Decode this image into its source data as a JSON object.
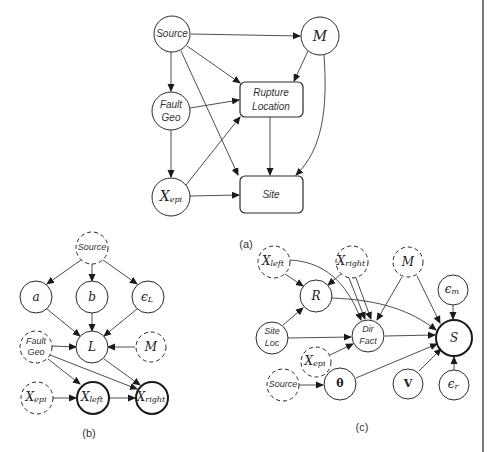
{
  "figure": {
    "panels": [
      {
        "id": "a",
        "caption": "(a)",
        "nodes": [
          {
            "id": "a_source",
            "label": "Source",
            "style": "solid",
            "shape": "circle"
          },
          {
            "id": "a_m",
            "label": "M",
            "style": "solid",
            "shape": "circle"
          },
          {
            "id": "a_faultgeo",
            "label_lines": [
              "Fault",
              "Geo"
            ],
            "style": "solid",
            "shape": "circle"
          },
          {
            "id": "a_rupture",
            "label_lines": [
              "Rupture",
              "Location"
            ],
            "style": "solid",
            "shape": "box"
          },
          {
            "id": "a_xepi",
            "label": "X",
            "sub": "epi",
            "style": "solid",
            "shape": "circle"
          },
          {
            "id": "a_site",
            "label": "Site",
            "style": "solid",
            "shape": "box"
          }
        ],
        "edges": [
          [
            "a_source",
            "a_m"
          ],
          [
            "a_source",
            "a_faultgeo"
          ],
          [
            "a_source",
            "a_rupture"
          ],
          [
            "a_source",
            "a_site"
          ],
          [
            "a_m",
            "a_rupture"
          ],
          [
            "a_m",
            "a_site"
          ],
          [
            "a_faultgeo",
            "a_rupture"
          ],
          [
            "a_faultgeo",
            "a_xepi"
          ],
          [
            "a_xepi",
            "a_rupture"
          ],
          [
            "a_xepi",
            "a_site"
          ],
          [
            "a_rupture",
            "a_site"
          ]
        ]
      },
      {
        "id": "b",
        "caption": "(b)",
        "nodes": [
          {
            "id": "b_source",
            "label": "Source",
            "style": "dashed"
          },
          {
            "id": "b_a",
            "label": "a",
            "style": "solid"
          },
          {
            "id": "b_b",
            "label": "b",
            "style": "solid"
          },
          {
            "id": "b_epsL",
            "label": "ϵ",
            "sub": "L",
            "style": "solid"
          },
          {
            "id": "b_faultgeo",
            "label_lines": [
              "Fault",
              "Geo"
            ],
            "style": "dashed"
          },
          {
            "id": "b_L",
            "label": "L",
            "style": "solid"
          },
          {
            "id": "b_m",
            "label": "M",
            "style": "dashed"
          },
          {
            "id": "b_xepi",
            "label": "X",
            "sub": "epi",
            "style": "dashed"
          },
          {
            "id": "b_xleft",
            "label": "X",
            "sub": "left",
            "style": "thick"
          },
          {
            "id": "b_xright",
            "label": "X",
            "sub": "right",
            "style": "thick"
          }
        ],
        "edges": [
          [
            "b_source",
            "b_a"
          ],
          [
            "b_source",
            "b_b"
          ],
          [
            "b_source",
            "b_epsL"
          ],
          [
            "b_a",
            "b_L"
          ],
          [
            "b_b",
            "b_L"
          ],
          [
            "b_epsL",
            "b_L"
          ],
          [
            "b_faultgeo",
            "b_L"
          ],
          [
            "b_m",
            "b_L"
          ],
          [
            "b_faultgeo",
            "b_xleft"
          ],
          [
            "b_faultgeo",
            "b_xright"
          ],
          [
            "b_L",
            "b_xright"
          ],
          [
            "b_xepi",
            "b_xleft"
          ],
          [
            "b_xleft",
            "b_xright"
          ]
        ]
      },
      {
        "id": "c",
        "caption": "(c)",
        "nodes": [
          {
            "id": "c_xleft",
            "label": "X",
            "sub": "left",
            "style": "dashed"
          },
          {
            "id": "c_xright",
            "label": "X",
            "sub": "right",
            "style": "dashed"
          },
          {
            "id": "c_m",
            "label": "M",
            "style": "dashed"
          },
          {
            "id": "c_epsm",
            "label": "ϵ",
            "sub": "m",
            "style": "solid"
          },
          {
            "id": "c_R",
            "label": "R",
            "style": "solid"
          },
          {
            "id": "c_siteloc",
            "label_lines": [
              "Site",
              "Loc"
            ],
            "style": "solid"
          },
          {
            "id": "c_dirfact",
            "label_lines": [
              "Dir",
              "Fact"
            ],
            "style": "solid"
          },
          {
            "id": "c_S",
            "label": "S",
            "style": "thick"
          },
          {
            "id": "c_xepi",
            "label": "X",
            "sub": "epi",
            "style": "dashed"
          },
          {
            "id": "c_source",
            "label": "Source",
            "style": "dashed"
          },
          {
            "id": "c_theta",
            "label": "θ",
            "style": "solid"
          },
          {
            "id": "c_V",
            "label": "V",
            "style": "solid"
          },
          {
            "id": "c_epsr",
            "label": "ϵ",
            "sub": "r",
            "style": "solid"
          }
        ],
        "edges": [
          [
            "c_xleft",
            "c_R"
          ],
          [
            "c_xright",
            "c_R"
          ],
          [
            "c_siteloc",
            "c_R"
          ],
          [
            "c_xleft",
            "c_dirfact"
          ],
          [
            "c_xright",
            "c_dirfact"
          ],
          [
            "c_m",
            "c_dirfact"
          ],
          [
            "c_siteloc",
            "c_dirfact"
          ],
          [
            "c_xepi",
            "c_dirfact"
          ],
          [
            "c_R",
            "c_S"
          ],
          [
            "c_m",
            "c_S"
          ],
          [
            "c_epsm",
            "c_S"
          ],
          [
            "c_dirfact",
            "c_S"
          ],
          [
            "c_theta",
            "c_S"
          ],
          [
            "c_V",
            "c_S"
          ],
          [
            "c_epsr",
            "c_S"
          ],
          [
            "c_source",
            "c_theta"
          ]
        ]
      }
    ]
  },
  "labels": {
    "source": "Source",
    "m": "M",
    "fault": "Fault",
    "geo": "Geo",
    "rupture": "Rupture",
    "location": "Location",
    "site": "Site",
    "x": "X",
    "epi": "epi",
    "left": "left",
    "right": "right",
    "a": "a",
    "b": "b",
    "eps": "ϵ",
    "L_sub": "L",
    "L": "L",
    "R": "R",
    "S": "S",
    "m_sub": "m",
    "r_sub": "r",
    "site_w": "Site",
    "loc": "Loc",
    "dir": "Dir",
    "fact": "Fact",
    "theta": "θ",
    "V": "V",
    "cap_a": "(a)",
    "cap_b": "(b)",
    "cap_c": "(c)"
  }
}
